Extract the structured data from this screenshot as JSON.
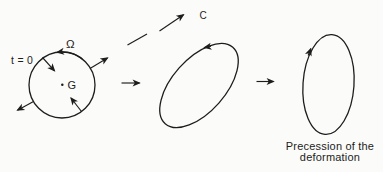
{
  "colors": {
    "background": "#fbfbf9",
    "ink": "#1d1d1b"
  },
  "diagram": {
    "initial_state": {
      "time_label": "t = 0",
      "spin_label": "Ω",
      "center_label": "G"
    },
    "reference_point_label": "C",
    "caption": {
      "line1": "Precession of the",
      "line2": "deformation"
    }
  }
}
